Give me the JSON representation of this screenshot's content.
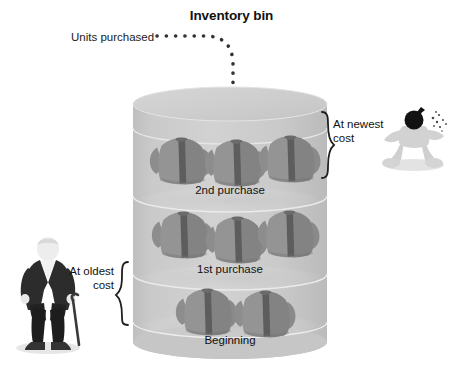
{
  "diagram": {
    "title": "Inventory bin",
    "background_color": "#ffffff",
    "text_color": "#111111"
  },
  "inflow": {
    "label": "Units purchased",
    "arrow_style": "dotted-curved",
    "arrow_color": "#333333"
  },
  "bin": {
    "fill_color": "#c9c9c9",
    "top_fill_color": "#cfcfcf",
    "edge_color": "#e9e9e9",
    "layers": [
      {
        "caption": "2nd purchase",
        "unit_count": 3
      },
      {
        "caption": "1st purchase",
        "unit_count": 3
      },
      {
        "caption": "Beginning",
        "unit_count": 2
      }
    ],
    "unit_icon": "sweater-icon",
    "unit_color": "#8e8e8e",
    "unit_shadow_color": "#5f5f5f"
  },
  "annotations": {
    "newest": {
      "line1": "At newest",
      "line2": "cost",
      "brace_side": "left-facing",
      "figure": "bomb-head-character"
    },
    "oldest": {
      "line1": "At oldest",
      "line2": "cost",
      "brace_side": "right-facing",
      "figure": "old-man-with-cane-character"
    }
  }
}
